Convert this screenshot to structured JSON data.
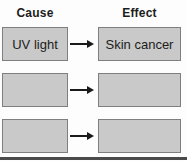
{
  "diagram": {
    "headers": {
      "cause": "Cause",
      "effect": "Effect"
    },
    "rows": [
      {
        "cause": "UV light",
        "effect": "Skin cancer"
      },
      {
        "cause": "",
        "effect": ""
      },
      {
        "cause": "",
        "effect": ""
      }
    ],
    "arrow_icon": "right-arrow",
    "colors": {
      "background": "#fdfdfd",
      "box_fill": "#c9c9c9",
      "box_border": "#7f7f7f",
      "text": "#1c1c1c",
      "arrow": "#1a1a1a",
      "bottom_rule": "#4a4a4a"
    }
  }
}
